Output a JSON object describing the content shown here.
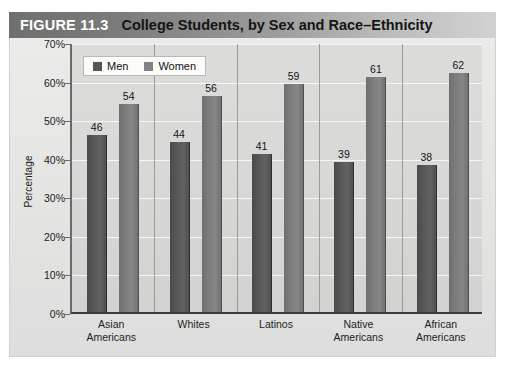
{
  "figure": {
    "number_label": "FIGURE 11.3",
    "caption": "College Students, by Sex and Race–Ethnicity"
  },
  "chart_data": {
    "type": "bar",
    "title": "College Students, by Sex and Race–Ethnicity",
    "xlabel": "",
    "ylabel": "Percentage",
    "ylim": [
      0,
      70
    ],
    "ytick_labels": [
      "0%",
      "10%",
      "20%",
      "30%",
      "40%",
      "50%",
      "60%",
      "70%"
    ],
    "ytick_values": [
      0,
      10,
      20,
      30,
      40,
      50,
      60,
      70
    ],
    "grid": true,
    "legend_position": "top-left",
    "categories": [
      "Asian Americans",
      "Whites",
      "Latinos",
      "Native Americans",
      "African Americans"
    ],
    "category_lines": [
      [
        "Asian",
        "Americans"
      ],
      [
        "Whites",
        ""
      ],
      [
        "Latinos",
        ""
      ],
      [
        "Native",
        "Americans"
      ],
      [
        "African",
        "Americans"
      ]
    ],
    "series": [
      {
        "name": "Men",
        "color": "#555555",
        "values": [
          46,
          44,
          41,
          39,
          38
        ]
      },
      {
        "name": "Women",
        "color": "#828282",
        "values": [
          54,
          56,
          59,
          61,
          62
        ]
      }
    ]
  }
}
